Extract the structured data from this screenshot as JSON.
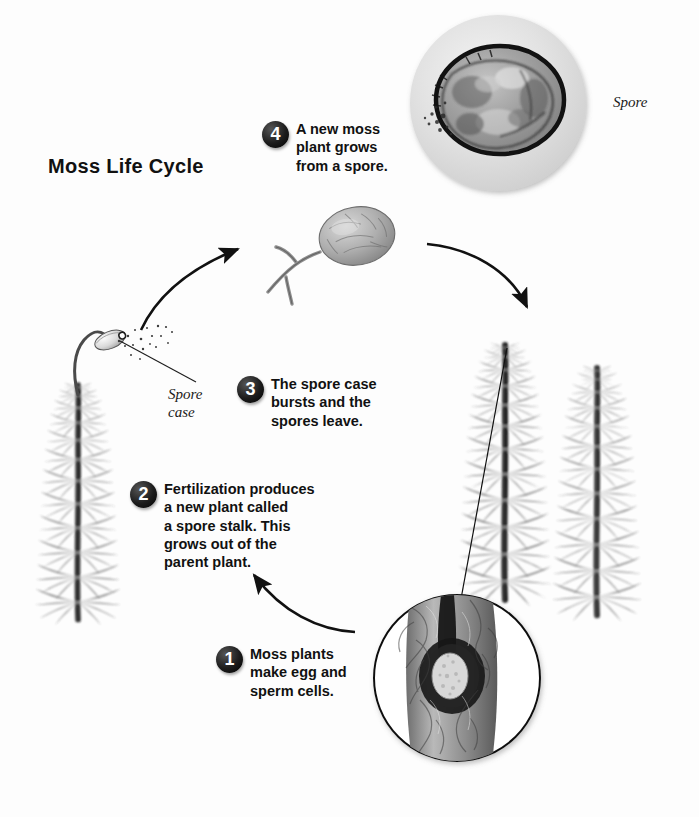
{
  "page": {
    "title": "Moss Life Cycle",
    "background_color": "#fdfdfd",
    "text_color": "#111111",
    "badge_color": "#1c1c1c",
    "badge_text_color": "#ffffff"
  },
  "steps": [
    {
      "number": "1",
      "text": "Moss plants\nmake egg and\nsperm cells."
    },
    {
      "number": "2",
      "text": "Fertilization produces\na new plant called\na spore stalk. This\ngrows out of the\nparent plant."
    },
    {
      "number": "3",
      "text": "The spore case\nbursts and the\nspores leave."
    },
    {
      "number": "4",
      "text": "A new moss\nplant grows\nfrom a spore."
    }
  ],
  "labels": {
    "spore_case": "Spore\ncase",
    "spore": "Spore"
  },
  "figures": {
    "spore_photo": "spore-micrograph-circle",
    "egg_inset_photo": "egg-cell-inset-circle",
    "germinating_spore": "germinating-spore-protonema",
    "parent_moss_plant": "moss-plant-with-spore-stalk",
    "moss_plant_right_front": "moss-plant-right-front",
    "moss_plant_right_back": "moss-plant-right-back"
  },
  "arrows": [
    {
      "name": "arrow-sporecase-to-germinating-spore",
      "direction": "up-right"
    },
    {
      "name": "arrow-germinating-spore-to-moss-plants",
      "direction": "down-right"
    },
    {
      "name": "arrow-step1-to-step2",
      "direction": "up-left"
    }
  ]
}
